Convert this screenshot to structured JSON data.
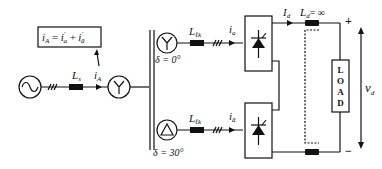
{
  "diagram": {
    "colors": {
      "stroke": "#111111",
      "background": "#ffffff"
    },
    "source": {
      "symbol": "ac-source",
      "glyph": "~"
    },
    "line_inductor": {
      "label_main": "L",
      "label_sub": "s"
    },
    "line_current": {
      "label_main": "i",
      "label_sub": "A"
    },
    "equation": {
      "lhs_main": "i",
      "lhs_sub": "A",
      "eq": "=",
      "t1_main": "i",
      "t1_sub": "a",
      "t1_prime": "′",
      "plus": "+",
      "t2_main": "i",
      "t2_sub": "ā",
      "t2_prime": "′"
    },
    "primary_winding": {
      "symbol": "Y"
    },
    "secondaries": [
      {
        "symbol": "Y",
        "phase_label": "δ = 0°",
        "inductor_main": "L",
        "inductor_sub": "ℓk",
        "current_main": "i",
        "current_sub": "a"
      },
      {
        "symbol": "Δ",
        "phase_label": "δ = 30°",
        "inductor_main": "L",
        "inductor_sub": "ℓk",
        "current_main": "i",
        "current_sub": "ā"
      }
    ],
    "dc_side": {
      "current_main": "I",
      "current_sub": "d",
      "inductor_main": "L",
      "inductor_sub": "d",
      "inductor_value": "= ∞",
      "plus": "+",
      "minus": "−",
      "voltage_main": "v",
      "voltage_sub": "d",
      "load_letters": [
        "L",
        "O",
        "A",
        "D"
      ]
    }
  }
}
